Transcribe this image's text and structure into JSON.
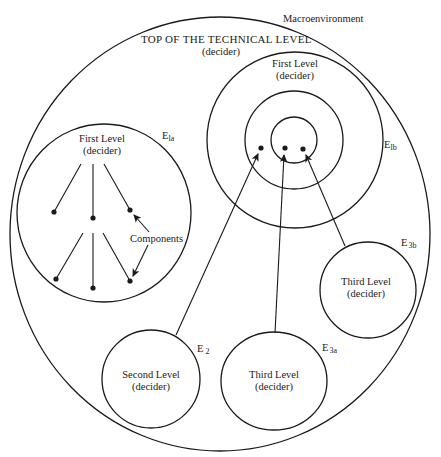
{
  "diagram": {
    "macroenvironment_label": "Macroenvironment",
    "top_level": {
      "title": "TOP OF THE TECHNICAL LEVEL",
      "role": "(decider)"
    },
    "e1a": {
      "title": "First Level",
      "role": "(decider)",
      "label_main": "E",
      "label_sub": "la",
      "components_label": "Components"
    },
    "e1b": {
      "title": "First Level",
      "role": "(decider)",
      "label_main": "E",
      "label_sub": "lb"
    },
    "e2": {
      "title": "Second Level",
      "role": "(decider)",
      "label_main": "E",
      "label_sub": "2"
    },
    "e3a": {
      "title": "Third Level",
      "role": "(decider)",
      "label_main": "E",
      "label_sub": "3a"
    },
    "e3b": {
      "title": "Third Level",
      "role": "(decider)",
      "label_main": "E",
      "label_sub": "3b"
    },
    "colors": {
      "line": "#1a1a1a",
      "background": "#ffffff"
    }
  }
}
